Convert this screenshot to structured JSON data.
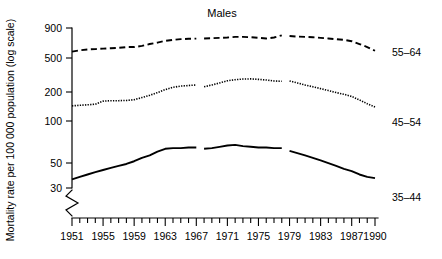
{
  "figure": {
    "title": "Males",
    "ylabel": "Mortality rate per 100 000 population (log scale)"
  },
  "chart_data": {
    "type": "line",
    "title": "Males",
    "xlabel": "",
    "ylabel": "Mortality rate per 100 000 population (log scale)",
    "yscale": "log",
    "ylim": [
      30,
      900
    ],
    "ytick_labels": [
      "900",
      "500",
      "200",
      "100",
      "50",
      "30"
    ],
    "yticks": [
      900,
      500,
      200,
      100,
      50,
      30
    ],
    "xlim": [
      1951,
      1990
    ],
    "xticks": [
      1951,
      1952,
      1953,
      1954,
      1955,
      1956,
      1957,
      1958,
      1959,
      1960,
      1961,
      1962,
      1963,
      1964,
      1965,
      1966,
      1967,
      1968,
      1969,
      1970,
      1971,
      1972,
      1973,
      1974,
      1975,
      1976,
      1977,
      1978,
      1979,
      1980,
      1981,
      1982,
      1983,
      1984,
      1985,
      1986,
      1987,
      1988,
      1989,
      1990
    ],
    "xtick_labels": [
      "1951",
      "1955",
      "1959",
      "1963",
      "1967",
      "1971",
      "1975",
      "1979",
      "1983",
      "1987",
      "1990"
    ],
    "xtick_label_years": [
      1951,
      1955,
      1959,
      1963,
      1967,
      1971,
      1975,
      1979,
      1983,
      1987,
      1990
    ],
    "grid": false,
    "legend": "right-inline",
    "axis_break_y": true,
    "series": [
      {
        "name": "55-64",
        "label": "55–64",
        "style": "dashed",
        "segments": [
          {
            "x": [
              1951,
              1952,
              1953,
              1954,
              1955,
              1956,
              1957,
              1958,
              1959,
              1960,
              1961,
              1962,
              1963,
              1964,
              1965,
              1966,
              1967
            ],
            "y": [
              545,
              560,
              570,
              575,
              580,
              585,
              590,
              600,
              600,
              615,
              640,
              660,
              685,
              700,
              710,
              715,
              718
            ]
          },
          {
            "x": [
              1968,
              1969,
              1970,
              1971,
              1972,
              1973,
              1974,
              1975,
              1976,
              1977,
              1978
            ],
            "y": [
              720,
              725,
              730,
              735,
              745,
              745,
              740,
              730,
              720,
              735,
              770
            ]
          },
          {
            "x": [
              1979,
              1980,
              1981,
              1982,
              1983,
              1984,
              1985,
              1986,
              1987,
              1988,
              1989,
              1990
            ],
            "y": [
              760,
              750,
              745,
              740,
              730,
              720,
              710,
              700,
              680,
              640,
              600,
              555
            ]
          }
        ]
      },
      {
        "name": "45-54",
        "label": "45–54",
        "style": "dotted",
        "segments": [
          {
            "x": [
              1951,
              1952,
              1953,
              1954,
              1955,
              1956,
              1957,
              1958,
              1959,
              1960,
              1961,
              1962,
              1963,
              1964,
              1965,
              1966,
              1967
            ],
            "y": [
              172,
              174,
              176,
              178,
              190,
              192,
              192,
              193,
              196,
              205,
              215,
              228,
              243,
              255,
              262,
              265,
              268
            ]
          },
          {
            "x": [
              1968,
              1969,
              1970,
              1971,
              1972,
              1973,
              1974,
              1975,
              1976,
              1977,
              1978
            ],
            "y": [
              258,
              268,
              280,
              293,
              300,
              304,
              305,
              302,
              298,
              292,
              290
            ]
          },
          {
            "x": [
              1979,
              1980,
              1981,
              1982,
              1983,
              1984,
              1985,
              1986,
              1987,
              1988,
              1989,
              1990
            ],
            "y": [
              292,
              280,
              268,
              258,
              248,
              238,
              228,
              220,
              210,
              195,
              180,
              168
            ]
          }
        ]
      },
      {
        "name": "35-44",
        "label": "35–44",
        "style": "solid",
        "segments": [
          {
            "x": [
              1951,
              1952,
              1953,
              1954,
              1955,
              1956,
              1957,
              1958,
              1959,
              1960,
              1961,
              1962,
              1963,
              1964,
              1965,
              1966,
              1967
            ],
            "y": [
              36,
              38,
              40,
              42,
              44,
              46,
              48,
              50,
              53,
              57,
              60,
              65,
              69,
              70,
              70,
              71,
              71
            ]
          },
          {
            "x": [
              1968,
              1969,
              1970,
              1971,
              1972,
              1973,
              1974,
              1975,
              1976,
              1977,
              1978
            ],
            "y": [
              69,
              70,
              72,
              74,
              75,
              73,
              72,
              71,
              71,
              70,
              70
            ]
          },
          {
            "x": [
              1979,
              1980,
              1981,
              1982,
              1983,
              1984,
              1985,
              1986,
              1987,
              1988,
              1989,
              1990
            ],
            "y": [
              66,
              63,
              60,
              57,
              54,
              51,
              48,
              45,
              43,
              40,
              38,
              37
            ]
          }
        ]
      }
    ]
  },
  "series_labels": {
    "s55_64": "55–64",
    "s45_54": "45–54",
    "s35_44": "35–44"
  },
  "ytick_labels": {
    "t900": "900",
    "t500": "500",
    "t200": "200",
    "t100": "100",
    "t50": "50",
    "t30": "30"
  },
  "xtick_labels": {
    "y1951": "1951",
    "y1955": "1955",
    "y1959": "1959",
    "y1963": "1963",
    "y1967": "1967",
    "y1971": "1971",
    "y1975": "1975",
    "y1979": "1979",
    "y1983": "1983",
    "y1987": "1987",
    "y1990": "1990"
  },
  "colors": {
    "ink": "#000000",
    "background": "#ffffff"
  }
}
